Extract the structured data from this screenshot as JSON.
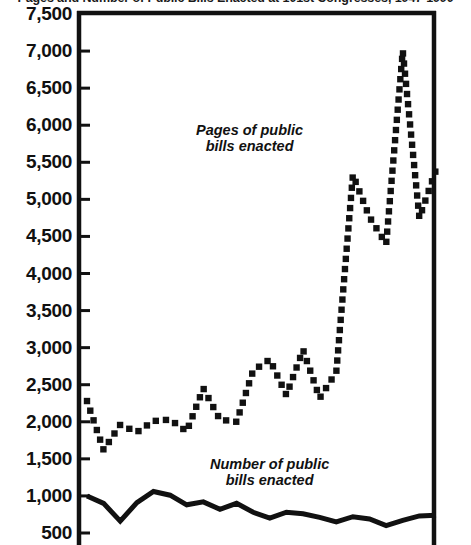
{
  "chart_data": {
    "type": "line",
    "title": "Pages and Number of Public Bills Enacted at 101st Congresses, 1947-1990",
    "xlabel": "",
    "ylabel": "",
    "ylim": [
      250,
      7500
    ],
    "yticks": [
      500,
      1000,
      1500,
      2000,
      2500,
      3000,
      3500,
      4000,
      4500,
      5000,
      5500,
      6000,
      6500,
      7000,
      7500
    ],
    "ytick_labels": [
      "500",
      "1,000",
      "1,500",
      "2,000",
      "2,500",
      "3,000",
      "3,500",
      "4,000",
      "4,500",
      "5,000",
      "5,500",
      "6,000",
      "6,500",
      "7,000",
      "7,500"
    ],
    "grid": false,
    "legend": "inline-annotations",
    "x": [
      1,
      2,
      3,
      4,
      5,
      6,
      7,
      8,
      9,
      10,
      11,
      12,
      13,
      14,
      15,
      16,
      17,
      18,
      19,
      20,
      21,
      22
    ],
    "series": [
      {
        "name": "Pages of public bills enacted",
        "style": "dotted",
        "color": "#111111",
        "values": [
          2280,
          1620,
          1960,
          1860,
          2010,
          2030,
          1870,
          2450,
          2030,
          2000,
          2690,
          2840,
          2360,
          2970,
          2320,
          2670,
          5330,
          4760,
          4400,
          7000,
          4750,
          5400
        ]
      },
      {
        "name": "Number of public bills enacted",
        "style": "solid",
        "color": "#111111",
        "values": [
          1000,
          900,
          660,
          910,
          1060,
          1010,
          880,
          920,
          820,
          900,
          780,
          700,
          780,
          760,
          710,
          650,
          720,
          690,
          600,
          670,
          730,
          740
        ]
      }
    ],
    "annotations": [
      {
        "id": "pages",
        "text": "Pages of public\nbills enacted"
      },
      {
        "id": "number",
        "text": "Number of public\nbills enacted"
      }
    ]
  },
  "axes": {
    "frame_color": "#111111",
    "tick_color": "#111111"
  }
}
